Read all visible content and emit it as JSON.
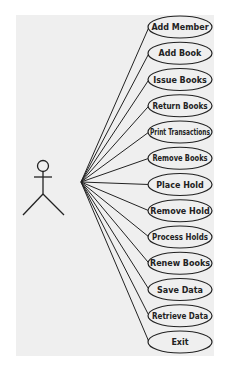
{
  "diagram": {
    "type": "use-case",
    "actor": {
      "label": ""
    },
    "use_cases": [
      "Add Member",
      "Add Book",
      "Issue Books",
      "Return Books",
      "Print Transactions",
      "Remove Books",
      "Place Hold",
      "Remove Hold",
      "Process Holds",
      "Renew Books",
      "Save Data",
      "Retrieve Data",
      "Exit"
    ]
  },
  "colors": {
    "background": "#efefef",
    "stroke": "#222222",
    "ellipse_fill": "#efefef"
  }
}
